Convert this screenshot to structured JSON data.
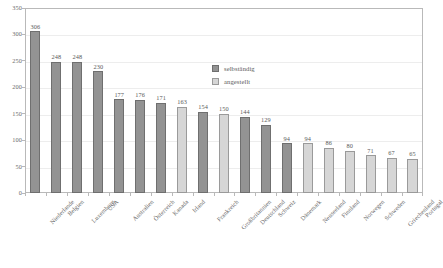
{
  "chart_data": {
    "type": "bar",
    "title": "",
    "subtitle": "",
    "xlabel": "",
    "ylabel": "",
    "ylim": [
      0,
      350
    ],
    "yticks": [
      0,
      50,
      100,
      150,
      200,
      250,
      300,
      350
    ],
    "grid": true,
    "legend_position": "inside-upper-right",
    "categories": [
      "Niederlande",
      "Belgien",
      "Luxemburg",
      "USA",
      "Australien",
      "Österreich",
      "Kanada",
      "Irland",
      "Frankreich",
      "Großbritannien",
      "Deutschland",
      "Schweiz",
      "Dänemark",
      "Neuseeland",
      "Finnland",
      "Norwegen",
      "Schweden",
      "Griechenland",
      "Portugal"
    ],
    "values": [
      306,
      248,
      248,
      230,
      177,
      176,
      171,
      163,
      154,
      150,
      144,
      129,
      94,
      94,
      86,
      80,
      71,
      67,
      65
    ],
    "point_groups": [
      "selbständig",
      "selbständig",
      "selbständig",
      "selbständig",
      "selbständig",
      "selbständig",
      "selbständig",
      "angestellt",
      "selbständig",
      "angestellt",
      "selbständig",
      "selbständig",
      "selbständig",
      "angestellt",
      "angestellt",
      "angestellt",
      "angestellt",
      "angestellt",
      "angestellt"
    ],
    "legend": [
      {
        "name": "selbständig",
        "color": "#939393"
      },
      {
        "name": "angestellt",
        "color": "#d6d6d6"
      }
    ]
  }
}
